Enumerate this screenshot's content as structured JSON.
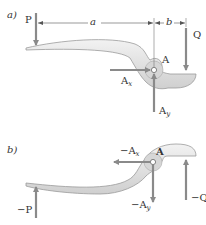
{
  "figure": {
    "panel_a": {
      "label": "a)",
      "forces": {
        "P": "P",
        "Q": "Q",
        "Ax": {
          "base": "A",
          "sub": "x"
        },
        "Ay": {
          "base": "A",
          "sub": "y"
        }
      },
      "point_label": "A",
      "dimensions": {
        "a": "a",
        "b": "b"
      }
    },
    "panel_b": {
      "label": "b)",
      "forces": {
        "neg_P": "−P",
        "neg_Q": "−Q",
        "neg_Ax": {
          "base": "−A",
          "sub": "x"
        },
        "neg_Ay": {
          "base": "−A",
          "sub": "y"
        }
      },
      "point_label": "A"
    },
    "colors": {
      "arrow": "#8a8a8a",
      "body_fill": "#e4e4e4",
      "body_stroke": "#9a9a9a",
      "text": "#333333"
    }
  }
}
